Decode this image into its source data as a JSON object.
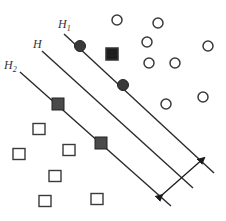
{
  "diagram": {
    "colors": {
      "line": "#2a2a2a",
      "support_fill": "#3a3a3a",
      "hollow_stroke": "#3a3a3a",
      "background": "#ffffff"
    },
    "labels": {
      "h1": {
        "main": "H",
        "sub": "1"
      },
      "h": {
        "main": "H",
        "sub": ""
      },
      "h2": {
        "main": "H",
        "sub": "2"
      }
    },
    "lines": [
      {
        "name": "H1",
        "x1": 64,
        "y1": 34,
        "x2": 214,
        "y2": 173
      },
      {
        "name": "H",
        "x1": 42,
        "y1": 51,
        "x2": 193,
        "y2": 188
      },
      {
        "name": "H2",
        "x1": 20,
        "y1": 72,
        "x2": 171,
        "y2": 206
      }
    ],
    "margin_arrow": {
      "x1": 162,
      "y1": 195,
      "x2": 204,
      "y2": 158
    },
    "support_circles": [
      {
        "x": 80,
        "y": 46
      },
      {
        "x": 123,
        "y": 85
      }
    ],
    "support_squares": [
      {
        "x": 58,
        "y": 104
      },
      {
        "x": 101,
        "y": 143
      }
    ],
    "misclassified_square": {
      "x": 112,
      "y": 54
    },
    "hollow_circles": [
      {
        "x": 117,
        "y": 20
      },
      {
        "x": 158,
        "y": 23
      },
      {
        "x": 147,
        "y": 42
      },
      {
        "x": 208,
        "y": 46
      },
      {
        "x": 149,
        "y": 63
      },
      {
        "x": 175,
        "y": 63
      },
      {
        "x": 166,
        "y": 104
      },
      {
        "x": 203,
        "y": 97
      }
    ],
    "hollow_squares": [
      {
        "x": 39,
        "y": 129
      },
      {
        "x": 19,
        "y": 154
      },
      {
        "x": 69,
        "y": 150
      },
      {
        "x": 55,
        "y": 176
      },
      {
        "x": 45,
        "y": 201
      },
      {
        "x": 97,
        "y": 199
      }
    ]
  }
}
